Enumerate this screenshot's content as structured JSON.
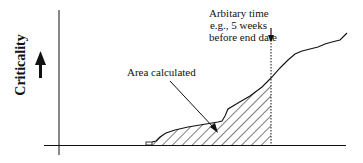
{
  "diagram": {
    "y_axis_label": "Criticality",
    "annotations": {
      "time_line1": "Arbitary time",
      "time_line2": "e.g., 5 weeks",
      "time_line3": "before end date",
      "area_label": "Area calculated"
    },
    "colors": {
      "line": "#111111",
      "background": "#ffffff"
    }
  }
}
